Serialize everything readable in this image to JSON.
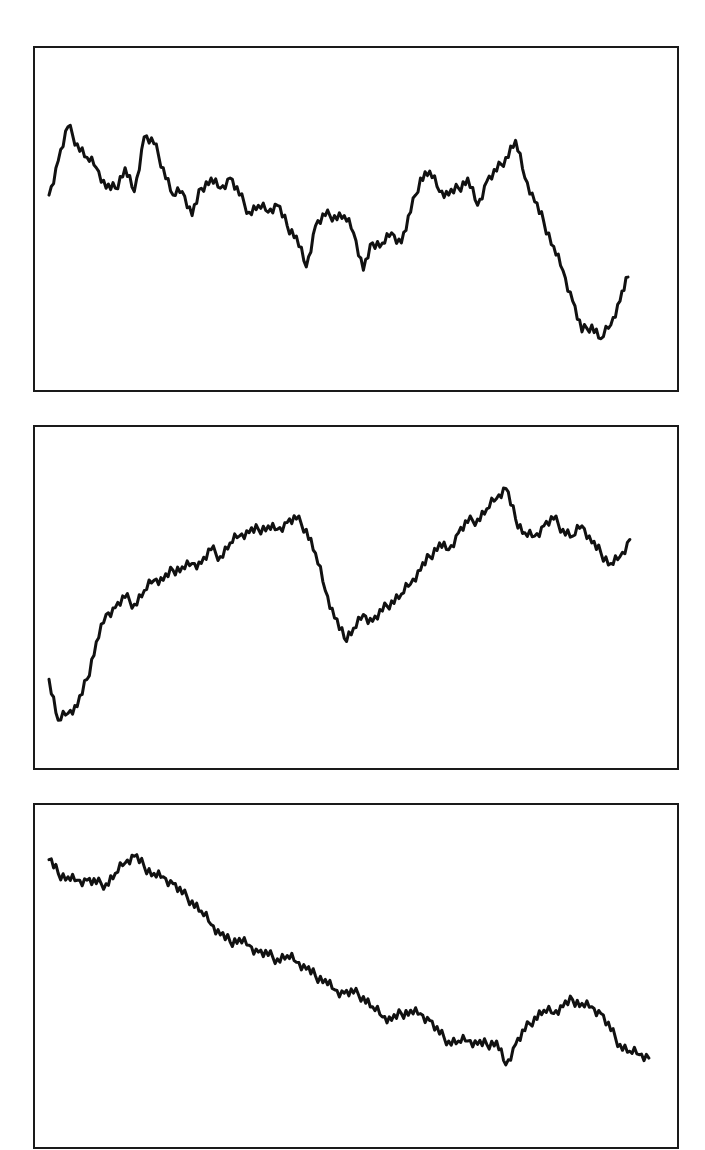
{
  "chart_data": [
    {
      "type": "line",
      "title": "",
      "xlabel": "",
      "ylabel": "",
      "grid": false,
      "legend": "none",
      "xlim": [
        0,
        100
      ],
      "ylim": [
        0,
        1
      ],
      "series": [
        {
          "name": "series-1",
          "color": "#111111",
          "x": [
            0,
            1.5,
            3.1,
            4.6,
            6.2,
            7.7,
            9.3,
            10.8,
            12.4,
            13.9,
            15.5,
            17.1,
            18.6,
            20.2,
            21.7,
            23.3,
            24.8,
            26.4,
            27.9,
            29.5,
            31.0,
            32.6,
            34.1,
            35.7,
            37.2,
            38.8,
            40.3,
            41.9,
            43.4,
            45.0,
            46.5,
            48.1,
            49.6,
            51.2,
            52.7,
            54.3,
            55.8,
            57.4,
            58.9,
            60.5,
            62.0,
            63.6,
            65.1,
            66.7,
            68.2,
            69.8,
            71.3,
            72.9,
            74.4,
            76.0,
            77.5,
            79.1,
            80.6,
            82.2,
            83.7,
            85.3,
            86.8,
            88.4,
            89.9,
            91.5,
            93.0,
            94.3
          ],
          "y": [
            0.57,
            0.67,
            0.77,
            0.72,
            0.68,
            0.65,
            0.59,
            0.59,
            0.65,
            0.58,
            0.74,
            0.72,
            0.65,
            0.57,
            0.58,
            0.51,
            0.59,
            0.62,
            0.59,
            0.62,
            0.57,
            0.52,
            0.54,
            0.52,
            0.54,
            0.48,
            0.45,
            0.36,
            0.48,
            0.51,
            0.51,
            0.51,
            0.46,
            0.35,
            0.43,
            0.43,
            0.46,
            0.43,
            0.52,
            0.62,
            0.64,
            0.58,
            0.57,
            0.59,
            0.62,
            0.54,
            0.61,
            0.64,
            0.68,
            0.73,
            0.62,
            0.55,
            0.49,
            0.42,
            0.35,
            0.26,
            0.17,
            0.19,
            0.15,
            0.19,
            0.26,
            0.33
          ]
        }
      ]
    },
    {
      "type": "line",
      "title": "",
      "xlabel": "",
      "ylabel": "",
      "grid": false,
      "legend": "none",
      "xlim": [
        0,
        100
      ],
      "ylim": [
        0,
        1
      ],
      "series": [
        {
          "name": "series-2",
          "color": "#111111",
          "x": [
            0,
            1.5,
            3.1,
            4.6,
            6.2,
            7.7,
            9.3,
            10.8,
            12.4,
            13.9,
            15.5,
            17.1,
            18.6,
            20.2,
            21.7,
            23.3,
            24.8,
            26.4,
            27.9,
            29.5,
            31.0,
            32.6,
            34.1,
            35.7,
            37.2,
            38.8,
            40.3,
            41.9,
            43.4,
            45.0,
            46.5,
            48.1,
            49.6,
            51.2,
            52.7,
            54.3,
            55.8,
            57.4,
            58.9,
            60.5,
            62.0,
            63.6,
            65.1,
            66.7,
            68.2,
            69.8,
            71.3,
            72.9,
            74.4,
            76.0,
            77.5,
            79.1,
            80.6,
            82.2,
            83.7,
            85.3,
            86.8,
            88.4,
            89.9,
            91.5,
            93.0,
            94.6
          ],
          "y": [
            0.26,
            0.14,
            0.16,
            0.18,
            0.26,
            0.37,
            0.45,
            0.47,
            0.5,
            0.48,
            0.52,
            0.55,
            0.55,
            0.58,
            0.59,
            0.6,
            0.6,
            0.64,
            0.62,
            0.66,
            0.68,
            0.69,
            0.7,
            0.71,
            0.7,
            0.72,
            0.73,
            0.7,
            0.63,
            0.52,
            0.44,
            0.38,
            0.41,
            0.45,
            0.43,
            0.46,
            0.49,
            0.51,
            0.54,
            0.58,
            0.62,
            0.66,
            0.64,
            0.69,
            0.72,
            0.73,
            0.76,
            0.79,
            0.82,
            0.73,
            0.69,
            0.68,
            0.71,
            0.73,
            0.7,
            0.68,
            0.71,
            0.66,
            0.63,
            0.6,
            0.62,
            0.67
          ]
        }
      ]
    },
    {
      "type": "line",
      "title": "",
      "xlabel": "",
      "ylabel": "",
      "grid": false,
      "legend": "none",
      "xlim": [
        0,
        100
      ],
      "ylim": [
        0,
        1
      ],
      "series": [
        {
          "name": "series-3",
          "color": "#111111",
          "x": [
            0,
            1.5,
            3.1,
            4.6,
            6.2,
            7.7,
            9.3,
            10.8,
            12.4,
            13.9,
            15.5,
            17.1,
            18.6,
            20.2,
            21.7,
            23.3,
            24.8,
            26.4,
            27.9,
            29.5,
            31.0,
            32.6,
            34.1,
            35.7,
            37.2,
            38.8,
            40.3,
            41.9,
            43.4,
            45.0,
            46.5,
            48.1,
            49.6,
            51.2,
            52.7,
            54.3,
            55.8,
            57.4,
            58.9,
            60.5,
            62.0,
            63.6,
            65.1,
            66.7,
            68.2,
            69.8,
            71.3,
            72.9,
            74.4,
            76.0,
            77.5,
            79.1,
            80.6,
            82.2,
            83.7,
            85.3,
            86.8,
            88.4,
            89.9,
            91.5,
            93.0,
            94.6,
            96.1,
            97.7
          ],
          "y": [
            0.84,
            0.8,
            0.79,
            0.78,
            0.78,
            0.77,
            0.77,
            0.8,
            0.83,
            0.85,
            0.82,
            0.8,
            0.79,
            0.77,
            0.74,
            0.72,
            0.69,
            0.65,
            0.62,
            0.6,
            0.61,
            0.59,
            0.57,
            0.56,
            0.55,
            0.56,
            0.54,
            0.52,
            0.5,
            0.49,
            0.46,
            0.45,
            0.45,
            0.44,
            0.41,
            0.38,
            0.37,
            0.39,
            0.4,
            0.39,
            0.37,
            0.33,
            0.31,
            0.31,
            0.31,
            0.3,
            0.3,
            0.31,
            0.24,
            0.3,
            0.34,
            0.38,
            0.4,
            0.39,
            0.41,
            0.43,
            0.42,
            0.41,
            0.39,
            0.34,
            0.3,
            0.28,
            0.27,
            0.26,
            0.24,
            0.27
          ]
        }
      ]
    }
  ]
}
